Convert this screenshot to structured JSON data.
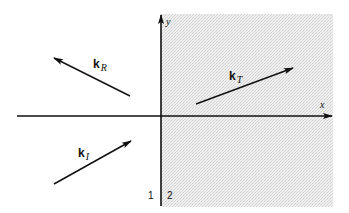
{
  "diagram": {
    "type": "wave-vectors-at-interface",
    "colors": {
      "line": "#111111",
      "medium2_fill": "#ececec",
      "background": "#ffffff"
    },
    "axes": {
      "x_label": "x",
      "y_label": "y"
    },
    "media": {
      "left_label": "1",
      "right_label": "2"
    },
    "vectors": [
      {
        "id": "incident",
        "label": "k",
        "subscript": "I",
        "tail": [
          54,
          184
        ],
        "head": [
          131,
          141
        ]
      },
      {
        "id": "reflected",
        "label": "k",
        "subscript": "R",
        "tail": [
          130,
          96
        ],
        "head": [
          54,
          58
        ]
      },
      {
        "id": "transmitted",
        "label": "k",
        "subscript": "T",
        "tail": [
          196,
          104
        ],
        "head": [
          293,
          68
        ]
      }
    ]
  }
}
